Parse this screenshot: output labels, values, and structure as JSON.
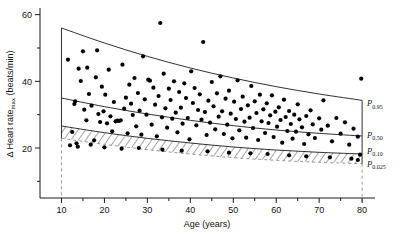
{
  "chart_data": {
    "type": "scatter",
    "title": "",
    "xlabel": "Age (years)",
    "ylabel": "Δ Heart rate",
    "ylabel_sub": "max",
    "ylabel_unit": " (beats/min)",
    "xlim": [
      5,
      83
    ],
    "ylim": [
      5,
      62
    ],
    "xticks": [
      10,
      20,
      30,
      40,
      50,
      60,
      70,
      80
    ],
    "xticklabels": [
      "10",
      "20",
      "30",
      "40",
      "50",
      "60",
      "70",
      "80"
    ],
    "xminor": [
      15,
      25,
      35,
      45,
      55,
      65,
      75
    ],
    "yticks": [
      20,
      40,
      60
    ],
    "yticklabels": [
      "20",
      "40",
      "60"
    ],
    "yminor": [
      10,
      30,
      50
    ],
    "grid": false,
    "legend_position": "right-outside",
    "annotations": [
      {
        "label": "P",
        "sub": "0.95",
        "x": 80,
        "y": 33.5
      },
      {
        "label": "P",
        "sub": "0.50",
        "x": 80,
        "y": 24.0
      },
      {
        "label": "P",
        "sub": "0.10",
        "x": 80,
        "y": 19.2
      },
      {
        "label": "P",
        "sub": "0.025",
        "x": 80,
        "y": 15.3
      }
    ],
    "percentile_curves": [
      {
        "name": "P0.95",
        "x": [
          10,
          20,
          30,
          40,
          50,
          60,
          70,
          80
        ],
        "y": [
          56.0,
          51.5,
          47.5,
          44.0,
          41.0,
          38.4,
          36.2,
          34.3
        ]
      },
      {
        "name": "P0.50",
        "x": [
          10,
          20,
          30,
          40,
          50,
          60,
          70,
          80
        ],
        "y": [
          35.0,
          32.4,
          30.2,
          28.3,
          26.7,
          25.4,
          24.4,
          23.6
        ]
      },
      {
        "name": "P0.10",
        "x": [
          10,
          20,
          30,
          40,
          50,
          60,
          70,
          80
        ],
        "y": [
          26.6,
          24.6,
          22.9,
          21.5,
          20.3,
          19.4,
          18.7,
          18.2
        ]
      },
      {
        "name": "P0.025",
        "x": [
          10,
          20,
          30,
          40,
          50,
          60,
          70,
          80
        ],
        "y": [
          22.9,
          21.1,
          19.5,
          18.2,
          17.1,
          16.3,
          15.7,
          15.3
        ]
      }
    ],
    "shaded_band": {
      "between": [
        "P0.10",
        "P0.025"
      ],
      "style": "hatched"
    },
    "points": [
      [
        11.5,
        46.5
      ],
      [
        12.5,
        24.8
      ],
      [
        13.0,
        33.2
      ],
      [
        13.2,
        34.0
      ],
      [
        13.5,
        21.4
      ],
      [
        14.0,
        43.8
      ],
      [
        14.5,
        40.1
      ],
      [
        15.0,
        49.0
      ],
      [
        15.3,
        31.5
      ],
      [
        15.8,
        28.3
      ],
      [
        16.0,
        44.1
      ],
      [
        16.4,
        36.2
      ],
      [
        17.0,
        32.7
      ],
      [
        17.6,
        22.3
      ],
      [
        18.0,
        41.2
      ],
      [
        18.3,
        49.3
      ],
      [
        18.6,
        30.2
      ],
      [
        19.0,
        27.8
      ],
      [
        19.4,
        38.4
      ],
      [
        19.8,
        31.0
      ],
      [
        20.2,
        36.0
      ],
      [
        20.6,
        27.4
      ],
      [
        21.0,
        43.5
      ],
      [
        21.4,
        29.5
      ],
      [
        21.8,
        25.0
      ],
      [
        22.2,
        33.8
      ],
      [
        22.6,
        28.0
      ],
      [
        23.0,
        28.2
      ],
      [
        23.4,
        28.1
      ],
      [
        23.8,
        28.3
      ],
      [
        24.2,
        45.0
      ],
      [
        24.6,
        31.8
      ],
      [
        25.0,
        35.1
      ],
      [
        25.4,
        24.4
      ],
      [
        25.8,
        39.0
      ],
      [
        26.2,
        33.3
      ],
      [
        26.6,
        29.9
      ],
      [
        27.0,
        41.0
      ],
      [
        27.4,
        26.5
      ],
      [
        27.8,
        36.5
      ],
      [
        28.2,
        31.2
      ],
      [
        28.6,
        24.0
      ],
      [
        29.0,
        47.5
      ],
      [
        29.4,
        34.6
      ],
      [
        29.8,
        30.0
      ],
      [
        30.2,
        40.5
      ],
      [
        30.6,
        40.2
      ],
      [
        31.0,
        27.0
      ],
      [
        31.4,
        38.1
      ],
      [
        31.8,
        33.0
      ],
      [
        32.2,
        23.5
      ],
      [
        32.6,
        35.6
      ],
      [
        33.0,
        57.5
      ],
      [
        33.4,
        29.2
      ],
      [
        33.8,
        42.3
      ],
      [
        34.2,
        31.9
      ],
      [
        34.6,
        26.1
      ],
      [
        35.0,
        37.8
      ],
      [
        35.4,
        34.4
      ],
      [
        35.8,
        28.8
      ],
      [
        36.2,
        40.0
      ],
      [
        36.6,
        30.6
      ],
      [
        37.0,
        24.7
      ],
      [
        37.4,
        36.8
      ],
      [
        37.8,
        32.1
      ],
      [
        38.2,
        27.3
      ],
      [
        38.6,
        39.4
      ],
      [
        39.0,
        35.0
      ],
      [
        39.4,
        29.0
      ],
      [
        39.8,
        22.6
      ],
      [
        40.2,
        43.0
      ],
      [
        40.6,
        33.5
      ],
      [
        41.0,
        38.0
      ],
      [
        41.4,
        26.8
      ],
      [
        41.8,
        31.4
      ],
      [
        42.2,
        36.1
      ],
      [
        42.6,
        28.5
      ],
      [
        43.0,
        51.8
      ],
      [
        43.4,
        30.8
      ],
      [
        43.8,
        23.9
      ],
      [
        44.2,
        34.2
      ],
      [
        44.6,
        27.6
      ],
      [
        45.0,
        39.8
      ],
      [
        45.4,
        32.5
      ],
      [
        45.8,
        25.6
      ],
      [
        46.2,
        36.4
      ],
      [
        46.6,
        29.4
      ],
      [
        47.0,
        41.5
      ],
      [
        47.4,
        31.0
      ],
      [
        47.8,
        24.2
      ],
      [
        48.2,
        34.8
      ],
      [
        48.6,
        27.0
      ],
      [
        49.0,
        37.2
      ],
      [
        49.4,
        30.3
      ],
      [
        49.8,
        22.9
      ],
      [
        50.2,
        33.9
      ],
      [
        50.6,
        28.7
      ],
      [
        51.0,
        40.3
      ],
      [
        51.4,
        25.3
      ],
      [
        51.8,
        31.7
      ],
      [
        52.2,
        35.4
      ],
      [
        52.6,
        27.9
      ],
      [
        53.0,
        23.1
      ],
      [
        53.4,
        32.8
      ],
      [
        53.8,
        29.1
      ],
      [
        54.2,
        38.6
      ],
      [
        54.6,
        26.0
      ],
      [
        55.0,
        34.0
      ],
      [
        55.4,
        30.5
      ],
      [
        55.8,
        22.4
      ],
      [
        56.2,
        36.0
      ],
      [
        56.6,
        28.0
      ],
      [
        57.0,
        31.6
      ],
      [
        57.4,
        24.5
      ],
      [
        57.8,
        33.4
      ],
      [
        58.2,
        27.5
      ],
      [
        58.6,
        29.8
      ],
      [
        59.0,
        35.8
      ],
      [
        59.4,
        23.3
      ],
      [
        59.8,
        30.9
      ],
      [
        60.2,
        26.4
      ],
      [
        60.6,
        32.2
      ],
      [
        61.0,
        28.4
      ],
      [
        61.4,
        21.6
      ],
      [
        61.8,
        34.5
      ],
      [
        62.2,
        29.3
      ],
      [
        62.6,
        25.1
      ],
      [
        63.0,
        31.1
      ],
      [
        63.4,
        27.2
      ],
      [
        63.8,
        22.8
      ],
      [
        64.2,
        30.0
      ],
      [
        64.6,
        24.9
      ],
      [
        65.0,
        33.1
      ],
      [
        65.4,
        28.6
      ],
      [
        66.0,
        26.2
      ],
      [
        66.5,
        21.2
      ],
      [
        67.0,
        29.6
      ],
      [
        67.5,
        24.1
      ],
      [
        68.0,
        31.3
      ],
      [
        68.5,
        27.1
      ],
      [
        69.0,
        23.0
      ],
      [
        70.0,
        28.9
      ],
      [
        70.5,
        25.5
      ],
      [
        71.0,
        34.3
      ],
      [
        72.0,
        26.7
      ],
      [
        73.0,
        22.0
      ],
      [
        74.0,
        29.0
      ],
      [
        75.0,
        24.3
      ],
      [
        76.0,
        27.7
      ],
      [
        77.0,
        21.0
      ],
      [
        78.0,
        25.8
      ],
      [
        79.0,
        23.4
      ],
      [
        79.5,
        18.0
      ],
      [
        79.8,
        40.8
      ],
      [
        12.0,
        20.8
      ],
      [
        13.8,
        20.4
      ],
      [
        16.8,
        21.0
      ],
      [
        20.0,
        20.2
      ],
      [
        24.0,
        19.8
      ],
      [
        28.0,
        20.0
      ],
      [
        33.5,
        19.5
      ],
      [
        38.0,
        19.2
      ],
      [
        44.0,
        19.0
      ],
      [
        49.0,
        18.6
      ],
      [
        54.0,
        18.4
      ],
      [
        58.0,
        18.2
      ],
      [
        63.0,
        17.8
      ],
      [
        67.0,
        17.5
      ],
      [
        72.5,
        17.2
      ],
      [
        77.5,
        16.8
      ],
      [
        79.0,
        16.4
      ]
    ],
    "n_points_approx": 180
  },
  "style": {
    "point_color": "#000000",
    "curve_color": "#1a1a1a",
    "dashed_color": "#8a8a8a",
    "background": "#ffffff"
  }
}
